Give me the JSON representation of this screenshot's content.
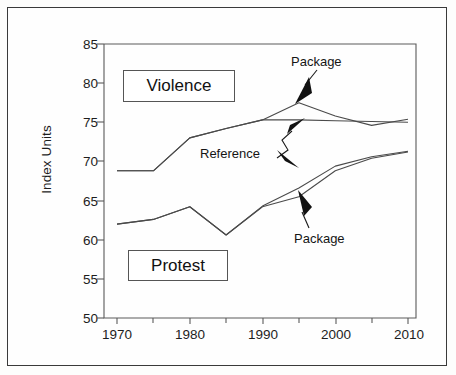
{
  "figure": {
    "background_color": "#fefefe",
    "border_color": "#3a3a3a",
    "line_color": "#4a4a4a",
    "text_color": "#1d1d1d"
  },
  "axis": {
    "ylabel": "Index Units",
    "yticks": [
      "85",
      "80",
      "75",
      "70",
      "65",
      "60",
      "55",
      "50"
    ],
    "xticks": [
      "1970",
      "1980",
      "1990",
      "2000",
      "2010"
    ]
  },
  "annotations": {
    "violence_box": "Violence",
    "protest_box": "Protest",
    "package_top": "Package",
    "reference": "Reference",
    "package_bottom": "Package"
  },
  "chart_data": {
    "type": "line",
    "title": "",
    "xlabel": "",
    "ylabel": "Index Units",
    "xlim": [
      1970,
      2010
    ],
    "ylim": [
      50,
      85
    ],
    "xticks": [
      1970,
      1980,
      1990,
      2000,
      2010
    ],
    "xticks_minor": [
      1975,
      1985,
      1995,
      2005
    ],
    "yticks": [
      50,
      55,
      60,
      65,
      70,
      75,
      80,
      85
    ],
    "grid": false,
    "legend": "inline-annotations",
    "groups": [
      {
        "group": "Violence",
        "series": [
          {
            "name": "Reference",
            "x": [
              1970,
              1975,
              1980,
              1985,
              1990,
              1995,
              2000,
              2005,
              2010
            ],
            "values": [
              68.8,
              68.8,
              73.0,
              74.2,
              75.3,
              75.3,
              75.2,
              75.1,
              75.0
            ]
          },
          {
            "name": "Package",
            "x": [
              1970,
              1975,
              1980,
              1985,
              1990,
              1995,
              2000,
              2005,
              2010
            ],
            "values": [
              68.8,
              68.8,
              73.0,
              74.2,
              75.3,
              77.5,
              75.8,
              74.6,
              75.4
            ]
          }
        ]
      },
      {
        "group": "Protest",
        "series": [
          {
            "name": "Reference",
            "x": [
              1970,
              1975,
              1980,
              1985,
              1990,
              1995,
              2000,
              2005,
              2010
            ],
            "values": [
              62.0,
              62.6,
              64.2,
              60.6,
              64.3,
              66.6,
              69.4,
              70.6,
              71.3
            ]
          },
          {
            "name": "Package",
            "x": [
              1970,
              1975,
              1980,
              1985,
              1990,
              1995,
              2000,
              2005,
              2010
            ],
            "values": [
              62.0,
              62.6,
              64.2,
              60.6,
              64.2,
              65.5,
              68.8,
              70.4,
              71.2
            ]
          }
        ]
      }
    ],
    "annotations": [
      {
        "text": "Violence",
        "type": "group-label-box",
        "x": 1972,
        "y": 80
      },
      {
        "text": "Protest",
        "type": "group-label-box",
        "x": 1972,
        "y": 57
      },
      {
        "text": "Package",
        "type": "arrow-label",
        "x": 1995,
        "y": 81.5,
        "points_to": "violence-package"
      },
      {
        "text": "Reference",
        "type": "arrow-label",
        "x": 1983,
        "y": 71.5,
        "points_to": "reference-lines"
      },
      {
        "text": "Package",
        "type": "arrow-label",
        "x": 1996,
        "y": 60.0,
        "points_to": "protest-package"
      }
    ]
  }
}
